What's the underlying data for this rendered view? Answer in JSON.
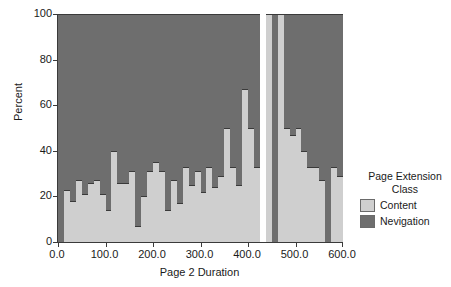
{
  "chart_data": {
    "type": "bar",
    "subtype": "stacked-100-percent-histogram",
    "title": "",
    "xlabel": "Page 2 Duration",
    "ylabel": "Percent",
    "ylim": [
      0,
      100
    ],
    "xlim": [
      0,
      600
    ],
    "ytick_labels": [
      "0",
      "20",
      "40",
      "60",
      "80",
      "100"
    ],
    "ytick_values": [
      0,
      20,
      40,
      60,
      80,
      100
    ],
    "xtick_labels": [
      "0.0",
      "100.0",
      "200.0",
      "300.0",
      "400.0",
      "500.0",
      "600.0"
    ],
    "xtick_values": [
      0,
      100,
      200,
      300,
      400,
      500,
      600
    ],
    "grid": false,
    "legend_position": "right",
    "legend_title": [
      "Page Extension",
      "Class"
    ],
    "series": [
      {
        "name": "Content",
        "color": "#cfcfcf"
      },
      {
        "name": "Nevigation",
        "color": "#6e6e6e"
      }
    ],
    "bin_width": 12.5,
    "bins": [
      {
        "x": 6.25,
        "content": 0,
        "navigation": 100
      },
      {
        "x": 18.75,
        "content": 23,
        "navigation": 77
      },
      {
        "x": 31.25,
        "content": 18,
        "navigation": 82
      },
      {
        "x": 43.75,
        "content": 27,
        "navigation": 73
      },
      {
        "x": 56.25,
        "content": 21,
        "navigation": 79
      },
      {
        "x": 68.75,
        "content": 26,
        "navigation": 74
      },
      {
        "x": 81.25,
        "content": 27,
        "navigation": 73
      },
      {
        "x": 93.75,
        "content": 21,
        "navigation": 79
      },
      {
        "x": 106.25,
        "content": 14,
        "navigation": 86
      },
      {
        "x": 118.75,
        "content": 40,
        "navigation": 60
      },
      {
        "x": 131.25,
        "content": 26,
        "navigation": 74
      },
      {
        "x": 143.75,
        "content": 26,
        "navigation": 74
      },
      {
        "x": 156.25,
        "content": 31,
        "navigation": 69
      },
      {
        "x": 168.75,
        "content": 7,
        "navigation": 93
      },
      {
        "x": 181.25,
        "content": 20,
        "navigation": 80
      },
      {
        "x": 193.75,
        "content": 31,
        "navigation": 69
      },
      {
        "x": 206.25,
        "content": 35,
        "navigation": 65
      },
      {
        "x": 218.75,
        "content": 31,
        "navigation": 69
      },
      {
        "x": 231.25,
        "content": 14,
        "navigation": 86
      },
      {
        "x": 243.75,
        "content": 27,
        "navigation": 73
      },
      {
        "x": 256.25,
        "content": 17,
        "navigation": 83
      },
      {
        "x": 268.75,
        "content": 33,
        "navigation": 67
      },
      {
        "x": 281.25,
        "content": 25,
        "navigation": 75
      },
      {
        "x": 293.75,
        "content": 31,
        "navigation": 69
      },
      {
        "x": 306.25,
        "content": 22,
        "navigation": 78
      },
      {
        "x": 318.75,
        "content": 33,
        "navigation": 67
      },
      {
        "x": 331.25,
        "content": 24,
        "navigation": 76
      },
      {
        "x": 343.75,
        "content": 29,
        "navigation": 71
      },
      {
        "x": 356.25,
        "content": 50,
        "navigation": 50
      },
      {
        "x": 368.75,
        "content": 33,
        "navigation": 67
      },
      {
        "x": 381.25,
        "content": 25,
        "navigation": 75
      },
      {
        "x": 393.75,
        "content": 67,
        "navigation": 33
      },
      {
        "x": 406.25,
        "content": 50,
        "navigation": 50
      },
      {
        "x": 418.75,
        "content": 33,
        "navigation": 67
      },
      {
        "x": 431.25,
        "content": 0,
        "navigation": 0
      },
      {
        "x": 443.75,
        "content": 100,
        "navigation": 0
      },
      {
        "x": 456.25,
        "content": 0,
        "navigation": 100
      },
      {
        "x": 468.75,
        "content": 100,
        "navigation": 0
      },
      {
        "x": 481.25,
        "content": 50,
        "navigation": 50
      },
      {
        "x": 493.75,
        "content": 47,
        "navigation": 53
      },
      {
        "x": 506.25,
        "content": 50,
        "navigation": 50
      },
      {
        "x": 518.75,
        "content": 40,
        "navigation": 60
      },
      {
        "x": 531.25,
        "content": 33,
        "navigation": 67
      },
      {
        "x": 543.75,
        "content": 33,
        "navigation": 67
      },
      {
        "x": 556.25,
        "content": 27,
        "navigation": 73
      },
      {
        "x": 568.75,
        "content": 0,
        "navigation": 100
      },
      {
        "x": 581.25,
        "content": 33,
        "navigation": 67
      },
      {
        "x": 593.75,
        "content": 29,
        "navigation": 71
      }
    ]
  },
  "colors": {
    "content": "#cfcfcf",
    "navigation": "#6e6e6e",
    "axis": "#3a3a3a",
    "text": "#1a1a1a",
    "background": "#ffffff"
  }
}
